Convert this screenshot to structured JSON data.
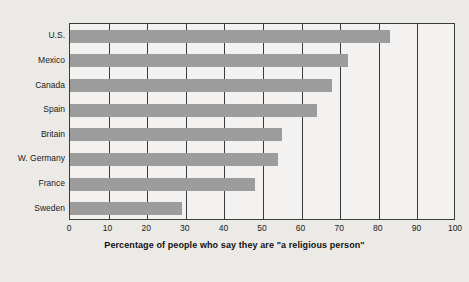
{
  "figure": {
    "background_color": "#eceae6",
    "plot_background_color": "#f3f2f0",
    "bar_color": "#9c9c9c",
    "axis_color": "#3b3b3b",
    "clipped_title": "",
    "xcaption": "Percentage of people who say they are \"a religious person\""
  },
  "chart_data": {
    "type": "bar",
    "orientation": "horizontal",
    "title": "",
    "xlabel": "Percentage of people who say they are \"a religious person\"",
    "ylabel": "",
    "xlim": [
      0,
      100
    ],
    "xticks": [
      0,
      10,
      20,
      30,
      40,
      50,
      60,
      70,
      80,
      90,
      100
    ],
    "xtick_labels": [
      "0",
      "10",
      "20",
      "30",
      "40",
      "50",
      "60",
      "70",
      "80",
      "90",
      "100"
    ],
    "grid": true,
    "grid_axis": "x",
    "legend": false,
    "categories": [
      "U.S.",
      "Mexico",
      "Canada",
      "Spain",
      "Britain",
      "W. Germany",
      "France",
      "Sweden"
    ],
    "values": [
      83,
      72,
      68,
      64,
      55,
      54,
      48,
      29
    ],
    "series": [
      {
        "name": "Percentage saying they are a religious person",
        "values": [
          83,
          72,
          68,
          64,
          55,
          54,
          48,
          29
        ],
        "color": "#9c9c9c"
      }
    ]
  }
}
